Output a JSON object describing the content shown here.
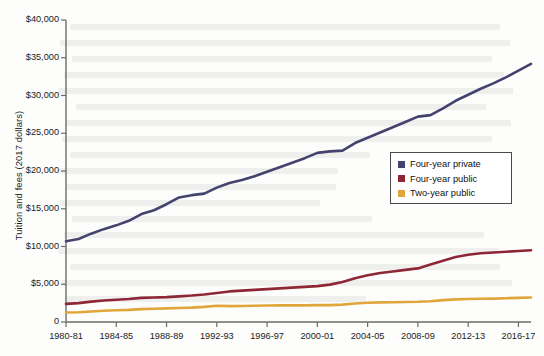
{
  "chart_data": {
    "type": "line",
    "title": "",
    "subtitle": "",
    "xlabel": "",
    "ylabel": "Tuition and fees (2017 dollars)",
    "ylim": [
      0,
      40000
    ],
    "ytick_values": [
      0,
      5000,
      10000,
      15000,
      20000,
      25000,
      30000,
      35000,
      40000
    ],
    "ytick_labels": [
      "0",
      "$5,000",
      "$10,000",
      "$15,000",
      "$20,000",
      "$25,000",
      "$30,000",
      "$35,000",
      "$40,000"
    ],
    "grid": false,
    "legend_position": "center-right",
    "x": [
      "1980-81",
      "1981-82",
      "1982-83",
      "1983-84",
      "1984-85",
      "1985-86",
      "1986-87",
      "1987-88",
      "1988-89",
      "1989-90",
      "1990-91",
      "1991-92",
      "1992-93",
      "1993-94",
      "1994-95",
      "1995-96",
      "1996-97",
      "1997-98",
      "1998-99",
      "1999-2000",
      "2000-01",
      "2001-02",
      "2002-03",
      "2003-04",
      "2004-05",
      "2005-06",
      "2006-07",
      "2007-08",
      "2008-09",
      "2009-10",
      "2010-11",
      "2011-12",
      "2012-13",
      "2013-14",
      "2014-15",
      "2015-16",
      "2016-17",
      "2017-18"
    ],
    "xtick_labels": [
      "1980-81",
      "1984-85",
      "1988-89",
      "1992-93",
      "1996-97",
      "2000-01",
      "2004-05",
      "2008-09",
      "2012-13",
      "2016-17"
    ],
    "xtick_indices": [
      0,
      4,
      8,
      12,
      16,
      20,
      24,
      28,
      32,
      36
    ],
    "series": [
      {
        "name": "Four-year private",
        "color": "#44436e",
        "values": [
          10700,
          11000,
          11700,
          12300,
          12800,
          13400,
          14300,
          14800,
          15600,
          16500,
          16800,
          17000,
          17800,
          18400,
          18800,
          19300,
          19900,
          20500,
          21100,
          21700,
          22400,
          22600,
          22700,
          23700,
          24400,
          25100,
          25800,
          26500,
          27200,
          27400,
          28300,
          29300,
          30100,
          30900,
          31600,
          32400,
          33300,
          34200
        ]
      },
      {
        "name": "Four-year public",
        "color": "#8e2735",
        "values": [
          2400,
          2500,
          2700,
          2850,
          2950,
          3050,
          3200,
          3250,
          3300,
          3400,
          3500,
          3650,
          3850,
          4050,
          4150,
          4250,
          4350,
          4450,
          4550,
          4650,
          4750,
          4950,
          5300,
          5800,
          6200,
          6500,
          6700,
          6900,
          7100,
          7600,
          8100,
          8600,
          8900,
          9100,
          9200,
          9300,
          9400,
          9500
        ]
      },
      {
        "name": "Two-year public",
        "color": "#e0a63a",
        "values": [
          1250,
          1300,
          1400,
          1500,
          1550,
          1600,
          1700,
          1750,
          1800,
          1850,
          1900,
          2000,
          2150,
          2100,
          2120,
          2150,
          2180,
          2200,
          2200,
          2200,
          2230,
          2230,
          2300,
          2450,
          2550,
          2600,
          2620,
          2650,
          2680,
          2750,
          2900,
          3000,
          3050,
          3080,
          3100,
          3150,
          3200,
          3250
        ]
      }
    ]
  },
  "axis": {
    "y_label": "Tuition and fees (2017 dollars)"
  },
  "legend": {
    "items": [
      {
        "label": "Four-year private",
        "color": "#44436e"
      },
      {
        "label": "Four-year public",
        "color": "#8e2735"
      },
      {
        "label": "Two-year public",
        "color": "#e0a63a"
      }
    ]
  }
}
